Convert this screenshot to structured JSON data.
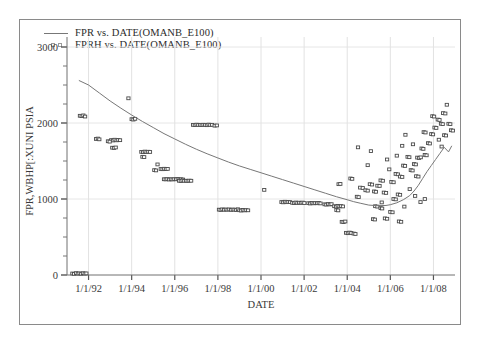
{
  "window": {
    "background": "#ffffff",
    "frame_color": "#8a8a8a"
  },
  "legend": {
    "position": "top-left",
    "entries": [
      {
        "marker": "line",
        "label": "FPR vs. DATE(OMANB_E100)",
        "color": "#777777"
      },
      {
        "marker": "open-square",
        "label": "FPRH vs. DATE(OMANB_E100)",
        "color": "#5a5a5a"
      }
    ]
  },
  "chart_data": {
    "type": "scatter",
    "title": "",
    "subtitle": "",
    "xlabel": "DATE",
    "ylabel": "FPR,WBHP[:XUNI PSIA",
    "xlim": [
      "1/1/1991",
      "1/1/2009"
    ],
    "ylim": [
      0,
      3000
    ],
    "ytick_values": [
      0,
      1000,
      2000,
      3000
    ],
    "ytick_labels": [
      "0",
      "1000",
      "2000",
      "3000"
    ],
    "y_minor_step": 250,
    "xtick_labels": [
      "1/1/92",
      "1/1/94",
      "1/1/96",
      "1/1/98",
      "1/1/00",
      "1/1/02",
      "1/1/04",
      "1/1/06",
      "1/1/08"
    ],
    "xtick_values": [
      1992.0,
      1994.0,
      1996.0,
      1998.0,
      2000.0,
      2002.0,
      2004.0,
      2006.0,
      2008.0
    ],
    "grid": true,
    "legend_position": "top-left",
    "series": [
      {
        "name": "FPR vs. DATE(OMANB_E100)",
        "type": "line",
        "color": "#777777",
        "x": [
          1991.55,
          1992.0,
          1992.5,
          1993.0,
          1993.5,
          1994.0,
          1994.5,
          1995.0,
          1995.5,
          1996.0,
          1996.5,
          1997.0,
          1997.5,
          1998.0,
          1998.5,
          1999.0,
          1999.5,
          2000.0,
          2000.5,
          2001.0,
          2001.5,
          2002.0,
          2002.5,
          2003.0,
          2003.5,
          2004.0,
          2004.3,
          2004.6,
          2005.0,
          2005.4,
          2005.8,
          2006.0,
          2006.3,
          2006.6,
          2006.9,
          2007.1,
          2007.3,
          2007.5,
          2007.7,
          2007.9,
          2008.1,
          2008.3,
          2008.5,
          2008.7,
          2008.85
        ],
        "y": [
          2560,
          2500,
          2395,
          2290,
          2195,
          2105,
          2020,
          1940,
          1860,
          1790,
          1720,
          1655,
          1595,
          1540,
          1485,
          1435,
          1390,
          1345,
          1300,
          1255,
          1210,
          1165,
          1120,
          1075,
          1030,
          990,
          965,
          945,
          920,
          912,
          915,
          925,
          950,
          990,
          1045,
          1105,
          1180,
          1270,
          1360,
          1440,
          1520,
          1600,
          1680,
          1620,
          1700
        ]
      },
      {
        "name": "FPRH vs. DATE(OMANB_E100)",
        "type": "scatter",
        "marker": "open-square",
        "color": "#4a4a4a",
        "points": [
          [
            1991.25,
            20
          ],
          [
            1991.33,
            15
          ],
          [
            1991.42,
            25
          ],
          [
            1991.5,
            18
          ],
          [
            1991.58,
            22
          ],
          [
            1991.66,
            16
          ],
          [
            1991.74,
            24
          ],
          [
            1991.82,
            19
          ],
          [
            1991.9,
            21
          ],
          [
            1991.6,
            2095
          ],
          [
            1991.68,
            2090
          ],
          [
            1991.76,
            2100
          ],
          [
            1991.84,
            2085
          ],
          [
            1992.35,
            1790
          ],
          [
            1992.43,
            1795
          ],
          [
            1992.5,
            1785
          ],
          [
            1993.05,
            1775
          ],
          [
            1993.13,
            1770
          ],
          [
            1993.21,
            1780
          ],
          [
            1993.3,
            1772
          ],
          [
            1993.38,
            1778
          ],
          [
            1993.46,
            1774
          ],
          [
            1992.9,
            1760
          ],
          [
            1992.98,
            1755
          ],
          [
            1993.1,
            1675
          ],
          [
            1993.18,
            1672
          ],
          [
            1993.26,
            1678
          ],
          [
            1993.85,
            2325
          ],
          [
            1994.0,
            2050
          ],
          [
            1994.08,
            2045
          ],
          [
            1994.16,
            2055
          ],
          [
            1994.45,
            1620
          ],
          [
            1994.53,
            1616
          ],
          [
            1994.61,
            1624
          ],
          [
            1994.69,
            1618
          ],
          [
            1994.77,
            1622
          ],
          [
            1994.85,
            1619
          ],
          [
            1994.5,
            1555
          ],
          [
            1994.58,
            1552
          ],
          [
            1995.35,
            1395
          ],
          [
            1995.43,
            1392
          ],
          [
            1995.51,
            1398
          ],
          [
            1995.59,
            1394
          ],
          [
            1995.67,
            1396
          ],
          [
            1995.2,
            1455
          ],
          [
            1995.05,
            1380
          ],
          [
            1995.13,
            1376
          ],
          [
            1995.5,
            1260
          ],
          [
            1995.58,
            1258
          ],
          [
            1995.66,
            1262
          ],
          [
            1995.74,
            1256
          ],
          [
            1995.82,
            1260
          ],
          [
            1995.9,
            1257
          ],
          [
            1995.98,
            1261
          ],
          [
            1996.06,
            1259
          ],
          [
            1996.14,
            1263
          ],
          [
            1996.22,
            1258
          ],
          [
            1996.3,
            1260
          ],
          [
            1996.38,
            1256
          ],
          [
            1996.2,
            1240
          ],
          [
            1996.28,
            1237
          ],
          [
            1996.36,
            1243
          ],
          [
            1996.44,
            1239
          ],
          [
            1996.52,
            1241
          ],
          [
            1996.6,
            1238
          ],
          [
            1996.68,
            1242
          ],
          [
            1996.76,
            1240
          ],
          [
            1996.85,
            1975
          ],
          [
            1996.93,
            1972
          ],
          [
            1997.01,
            1978
          ],
          [
            1997.09,
            1974
          ],
          [
            1997.17,
            1976
          ],
          [
            1997.25,
            1973
          ],
          [
            1997.33,
            1977
          ],
          [
            1997.41,
            1975
          ],
          [
            1997.49,
            1971
          ],
          [
            1997.57,
            1979
          ],
          [
            1997.65,
            1974
          ],
          [
            1997.73,
            1976
          ],
          [
            1997.85,
            1965
          ],
          [
            1997.95,
            1968
          ],
          [
            1998.05,
            860
          ],
          [
            1998.13,
            856
          ],
          [
            1998.21,
            864
          ],
          [
            1998.29,
            858
          ],
          [
            1998.37,
            862
          ],
          [
            1998.45,
            859
          ],
          [
            1998.53,
            863
          ],
          [
            1998.61,
            857
          ],
          [
            1998.69,
            861
          ],
          [
            1998.77,
            860
          ],
          [
            1998.85,
            855
          ],
          [
            1998.93,
            865
          ],
          [
            1999.0,
            852
          ],
          [
            1999.08,
            848
          ],
          [
            1999.16,
            856
          ],
          [
            1999.24,
            850
          ],
          [
            1999.32,
            854
          ],
          [
            1999.4,
            851
          ],
          [
            2000.15,
            1120
          ],
          [
            2000.95,
            960
          ],
          [
            2001.03,
            956
          ],
          [
            2001.11,
            964
          ],
          [
            2001.19,
            958
          ],
          [
            2001.27,
            962
          ],
          [
            2001.35,
            959
          ],
          [
            2001.45,
            950
          ],
          [
            2001.53,
            946
          ],
          [
            2001.61,
            954
          ],
          [
            2001.69,
            948
          ],
          [
            2001.77,
            952
          ],
          [
            2001.85,
            949
          ],
          [
            2001.93,
            953
          ],
          [
            2002.01,
            947
          ],
          [
            2002.2,
            945
          ],
          [
            2002.28,
            941
          ],
          [
            2002.36,
            949
          ],
          [
            2002.44,
            943
          ],
          [
            2002.52,
            947
          ],
          [
            2002.6,
            944
          ],
          [
            2002.68,
            948
          ],
          [
            2002.76,
            942
          ],
          [
            2002.95,
            930
          ],
          [
            2003.03,
            926
          ],
          [
            2003.11,
            934
          ],
          [
            2003.19,
            928
          ],
          [
            2003.27,
            932
          ],
          [
            2003.4,
            905
          ],
          [
            2003.48,
            900
          ],
          [
            2003.56,
            910
          ],
          [
            2003.64,
            903
          ],
          [
            2003.72,
            907
          ],
          [
            2003.8,
            902
          ],
          [
            2003.5,
            855
          ],
          [
            2003.58,
            850
          ],
          [
            2003.75,
            700
          ],
          [
            2003.83,
            696
          ],
          [
            2003.91,
            704
          ],
          [
            2003.95,
            555
          ],
          [
            2004.03,
            550
          ],
          [
            2004.11,
            558
          ],
          [
            2004.19,
            553
          ],
          [
            2004.3,
            545
          ],
          [
            2004.38,
            540
          ],
          [
            2003.6,
            1195
          ],
          [
            2003.68,
            1198
          ],
          [
            2004.15,
            1270
          ],
          [
            2004.23,
            1265
          ],
          [
            2004.45,
            1030
          ],
          [
            2004.53,
            1025
          ],
          [
            2004.6,
            1150
          ],
          [
            2004.72,
            1145
          ],
          [
            2004.85,
            1115
          ],
          [
            2004.95,
            1110
          ],
          [
            2004.5,
            1680
          ],
          [
            2005.05,
            1195
          ],
          [
            2005.15,
            1190
          ],
          [
            2005.25,
            1100
          ],
          [
            2005.33,
            1095
          ],
          [
            2005.4,
            1175
          ],
          [
            2005.5,
            1172
          ],
          [
            2005.55,
            1245
          ],
          [
            2005.65,
            1240
          ],
          [
            2005.7,
            1085
          ],
          [
            2005.8,
            1080
          ],
          [
            2005.3,
            905
          ],
          [
            2005.4,
            900
          ],
          [
            2005.55,
            880
          ],
          [
            2005.62,
            875
          ],
          [
            2005.75,
            745
          ],
          [
            2005.85,
            740
          ],
          [
            2005.2,
            735
          ],
          [
            2005.28,
            730
          ],
          [
            2005.95,
            1390
          ],
          [
            2006.05,
            1225
          ],
          [
            2006.15,
            1220
          ],
          [
            2006.25,
            1330
          ],
          [
            2006.35,
            1325
          ],
          [
            2006.45,
            1295
          ],
          [
            2006.55,
            1290
          ],
          [
            2006.6,
            1440
          ],
          [
            2006.68,
            1435
          ],
          [
            2006.15,
            1000
          ],
          [
            2006.25,
            995
          ],
          [
            2006.35,
            1060
          ],
          [
            2006.45,
            1055
          ],
          [
            2006.0,
            830
          ],
          [
            2006.1,
            825
          ],
          [
            2006.4,
            705
          ],
          [
            2006.5,
            700
          ],
          [
            2006.8,
            1555
          ],
          [
            2006.88,
            1550
          ],
          [
            2006.95,
            1380
          ],
          [
            2007.03,
            1375
          ],
          [
            2007.1,
            1460
          ],
          [
            2007.18,
            1455
          ],
          [
            2007.25,
            1545
          ],
          [
            2007.33,
            1540
          ],
          [
            2007.41,
            1548
          ],
          [
            2007.2,
            1300
          ],
          [
            2007.3,
            1295
          ],
          [
            2007.45,
            1665
          ],
          [
            2007.53,
            1660
          ],
          [
            2007.6,
            1580
          ],
          [
            2007.68,
            1575
          ],
          [
            2007.75,
            1735
          ],
          [
            2007.83,
            1730
          ],
          [
            2007.9,
            1855
          ],
          [
            2007.98,
            1850
          ],
          [
            2007.55,
            1880
          ],
          [
            2007.63,
            1875
          ],
          [
            2008.05,
            1940
          ],
          [
            2008.13,
            1935
          ],
          [
            2008.2,
            2045
          ],
          [
            2008.28,
            2040
          ],
          [
            2008.35,
            1990
          ],
          [
            2008.43,
            1985
          ],
          [
            2008.5,
            1840
          ],
          [
            2008.58,
            1835
          ],
          [
            2008.45,
            2130
          ],
          [
            2008.55,
            2125
          ],
          [
            2008.62,
            2240
          ],
          [
            2008.7,
            1990
          ],
          [
            2008.78,
            1985
          ],
          [
            2008.82,
            1905
          ],
          [
            2008.9,
            1900
          ],
          [
            2007.95,
            2090
          ],
          [
            2008.03,
            2085
          ],
          [
            2006.7,
            1845
          ],
          [
            2006.3,
            1570
          ],
          [
            2005.1,
            1630
          ],
          [
            2004.95,
            1445
          ],
          [
            2005.85,
            1520
          ],
          [
            2006.55,
            1700
          ],
          [
            2007.05,
            1720
          ],
          [
            2008.25,
            1780
          ],
          [
            2008.38,
            1690
          ],
          [
            2006.9,
            1130
          ],
          [
            2007.15,
            1040
          ],
          [
            2007.4,
            960
          ],
          [
            2007.6,
            1000
          ],
          [
            2006.65,
            900
          ],
          [
            2005.6,
            955
          ]
        ]
      }
    ]
  }
}
